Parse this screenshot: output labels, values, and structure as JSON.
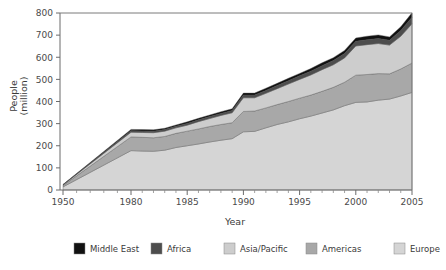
{
  "chart_data": {
    "type": "area",
    "title": "",
    "xlabel": "Year",
    "ylabel": "People\n(million)",
    "ylabel_line1": "People",
    "ylabel_line2": "(million)",
    "ylim": [
      0,
      800
    ],
    "ytick_values": [
      0,
      100,
      200,
      300,
      400,
      500,
      600,
      700,
      800
    ],
    "ytick_labels": [
      "0",
      "100",
      "200",
      "300",
      "400",
      "500",
      "600",
      "700",
      "800"
    ],
    "xtick_labels": [
      "1950",
      "1980",
      "1985",
      "1990",
      "1995",
      "2000",
      "2005"
    ],
    "xtick_values": [
      1950,
      1980,
      1985,
      1990,
      1995,
      2000,
      2005
    ],
    "grid": false,
    "legend_position": "bottom",
    "stacked": true,
    "x": [
      1950,
      1980,
      1981,
      1982,
      1983,
      1984,
      1985,
      1986,
      1987,
      1988,
      1989,
      1990,
      1991,
      1992,
      1993,
      1994,
      1995,
      1996,
      1997,
      1998,
      1999,
      2000,
      2001,
      2002,
      2003,
      2004,
      2005
    ],
    "series": [
      {
        "name": "Europe",
        "color": "#d5d5d5",
        "values": [
          14,
          178,
          176,
          175,
          180,
          192,
          200,
          208,
          217,
          225,
          232,
          263,
          265,
          281,
          296,
          308,
          322,
          334,
          348,
          362,
          381,
          396,
          398,
          406,
          411,
          425,
          441
        ]
      },
      {
        "name": "Americas",
        "color": "#a8a8a8",
        "values": [
          6,
          62,
          62,
          61,
          62,
          64,
          66,
          68,
          70,
          71,
          72,
          92,
          92,
          90,
          90,
          92,
          93,
          95,
          98,
          102,
          106,
          123,
          124,
          120,
          114,
          122,
          133
        ]
      },
      {
        "name": "Asia/Pacific",
        "color": "#cdcdcd",
        "values": [
          3,
          21,
          22,
          23,
          24,
          25,
          27,
          33,
          36,
          41,
          45,
          62,
          60,
          66,
          72,
          79,
          85,
          91,
          98,
          102,
          110,
          132,
          135,
          136,
          130,
          148,
          177
        ]
      },
      {
        "name": "Africa",
        "color": "#4d4d4d",
        "values": [
          1,
          7,
          7,
          7,
          7,
          7,
          8,
          8,
          9,
          9,
          10,
          12,
          12,
          13,
          14,
          15,
          16,
          17,
          18,
          19,
          20,
          21,
          22,
          23,
          22,
          26,
          30
        ]
      },
      {
        "name": "Middle East",
        "color": "#111111",
        "values": [
          1,
          6,
          6,
          6,
          6,
          6,
          7,
          7,
          7,
          8,
          8,
          9,
          9,
          10,
          10,
          11,
          11,
          12,
          13,
          13,
          14,
          15,
          16,
          16,
          15,
          17,
          20
        ]
      }
    ],
    "totals": [
      25,
      274,
      273,
      272,
      279,
      294,
      308,
      324,
      339,
      354,
      367,
      438,
      438,
      460,
      482,
      505,
      527,
      549,
      575,
      598,
      631,
      687,
      695,
      701,
      692,
      738,
      801
    ]
  },
  "legend": {
    "items": [
      {
        "label": "Middle East",
        "color": "#111111"
      },
      {
        "label": "Africa",
        "color": "#4d4d4d"
      },
      {
        "label": "Asia/Pacific",
        "color": "#cdcdcd"
      },
      {
        "label": "Americas",
        "color": "#a8a8a8"
      },
      {
        "label": "Europe",
        "color": "#d5d5d5"
      }
    ]
  }
}
